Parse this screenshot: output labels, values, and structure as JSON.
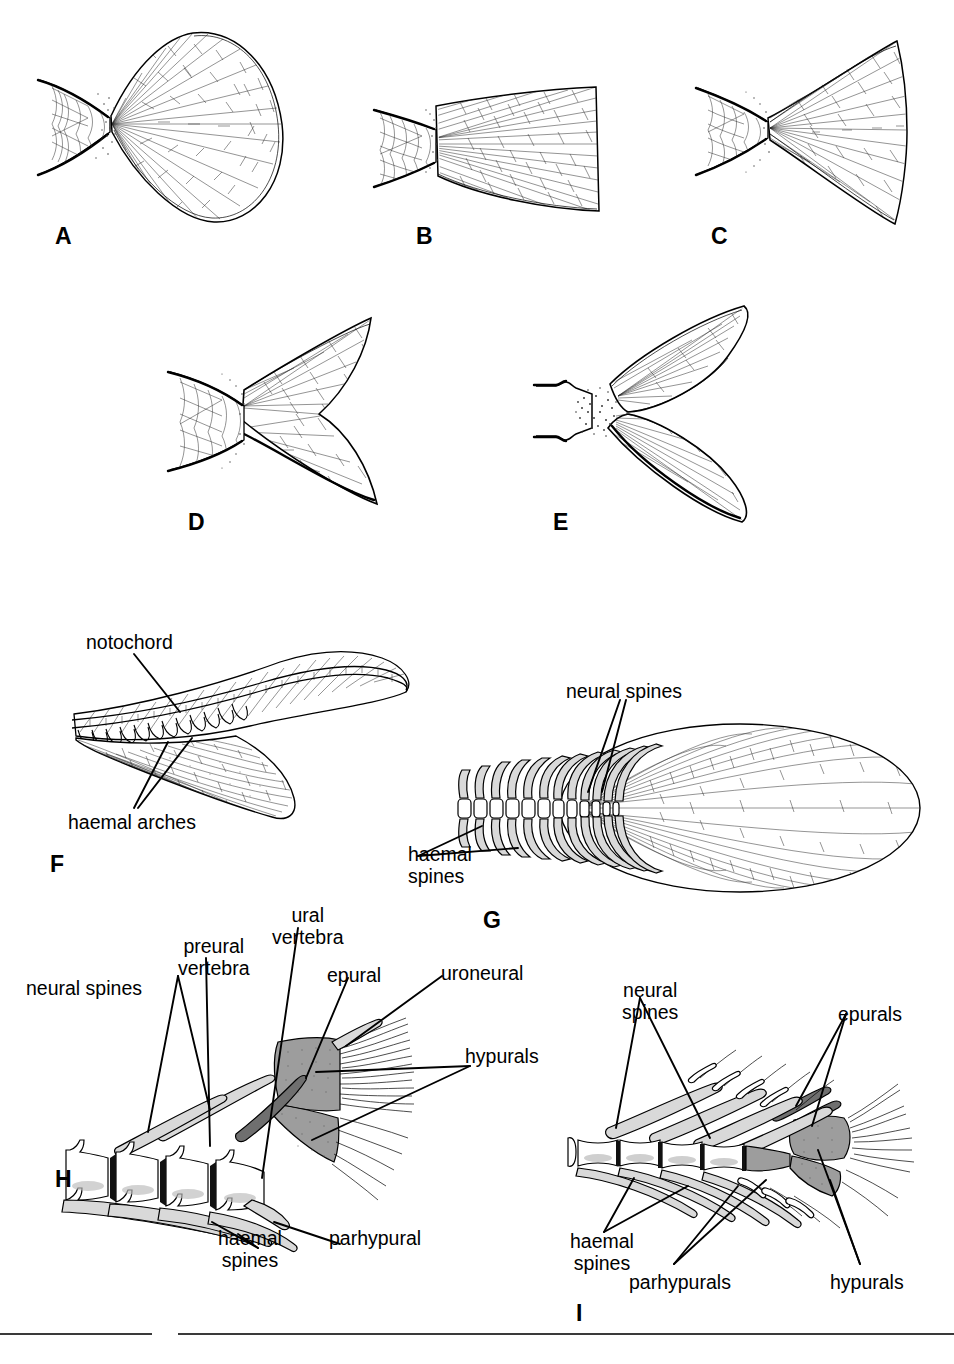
{
  "figure": {
    "kind": "scientific-illustration",
    "background_color": "#ffffff",
    "ink_color": "#000000",
    "shade_colors": {
      "light": "#d9d9d9",
      "medium": "#9d9d9d",
      "dark": "#6f6f6f",
      "white": "#ffffff"
    }
  },
  "panels": [
    {
      "id": "A",
      "letter": "A",
      "caption": "",
      "description": "rounded (fan-shaped) homocercal caudal fin"
    },
    {
      "id": "B",
      "letter": "B",
      "caption": "",
      "description": "truncate homocercal caudal fin"
    },
    {
      "id": "C",
      "letter": "C",
      "caption": "",
      "description": "emarginate caudal fin"
    },
    {
      "id": "D",
      "letter": "D",
      "caption": "",
      "description": "forked caudal fin"
    },
    {
      "id": "E",
      "letter": "E",
      "caption": "",
      "description": "deeply forked / lunate caudal fin"
    },
    {
      "id": "F",
      "letter": "F",
      "caption": "",
      "description": "heterocercal caudal fin skeleton"
    },
    {
      "id": "G",
      "letter": "G",
      "caption": "",
      "description": "diphycercal caudal fin skeleton"
    },
    {
      "id": "H",
      "letter": "H",
      "caption": "",
      "description": "homocercal caudal skeleton, detail"
    },
    {
      "id": "I",
      "letter": "I",
      "caption": "",
      "description": "homocercal caudal skeleton, alternate form"
    }
  ],
  "annotations": {
    "F": [
      {
        "text": "notochord",
        "x": 86,
        "y": 632
      },
      {
        "text": "haemal arches",
        "x": 68,
        "y": 812
      }
    ],
    "G": [
      {
        "text": "neural spines",
        "x": 566,
        "y": 681
      },
      {
        "text": "haemal",
        "x": 408,
        "y": 844
      },
      {
        "text": "spines",
        "x": 408,
        "y": 866
      }
    ],
    "H": [
      {
        "text": "neural spines",
        "x": 26,
        "y": 978
      },
      {
        "text": "preural",
        "x": 190,
        "y": 936
      },
      {
        "text": "vertebra",
        "x": 182,
        "y": 958
      },
      {
        "text": "ural",
        "x": 286,
        "y": 905
      },
      {
        "text": "vertebra",
        "x": 272,
        "y": 927
      },
      {
        "text": "epural",
        "x": 327,
        "y": 965
      },
      {
        "text": "uroneural",
        "x": 441,
        "y": 963
      },
      {
        "text": "hypurals",
        "x": 465,
        "y": 1046
      },
      {
        "text": "haemal",
        "x": 221,
        "y": 1228
      },
      {
        "text": "spines",
        "x": 224,
        "y": 1250
      },
      {
        "text": "parhypural",
        "x": 329,
        "y": 1228
      }
    ],
    "I": [
      {
        "text": "neural",
        "x": 628,
        "y": 980
      },
      {
        "text": "spines",
        "x": 628,
        "y": 1002
      },
      {
        "text": "epurals",
        "x": 838,
        "y": 1004
      },
      {
        "text": "haemal",
        "x": 573,
        "y": 1231
      },
      {
        "text": "spines",
        "x": 573,
        "y": 1253
      },
      {
        "text": "parhypurals",
        "x": 629,
        "y": 1272
      },
      {
        "text": "hypurals",
        "x": 830,
        "y": 1272
      }
    ]
  },
  "panel_letters": [
    {
      "letter": "A",
      "x": 55,
      "y": 225
    },
    {
      "letter": "B",
      "x": 416,
      "y": 225
    },
    {
      "letter": "C",
      "x": 711,
      "y": 225
    },
    {
      "letter": "D",
      "x": 188,
      "y": 511
    },
    {
      "letter": "E",
      "x": 553,
      "y": 511
    },
    {
      "letter": "F",
      "x": 50,
      "y": 853
    },
    {
      "letter": "G",
      "x": 483,
      "y": 909
    },
    {
      "letter": "H",
      "x": 55,
      "y": 1168
    },
    {
      "letter": "I",
      "x": 576,
      "y": 1302
    }
  ],
  "footer_rules": [
    {
      "x": 0,
      "y": 1333,
      "width": 152
    },
    {
      "x": 178,
      "y": 1333,
      "width": 776
    }
  ]
}
